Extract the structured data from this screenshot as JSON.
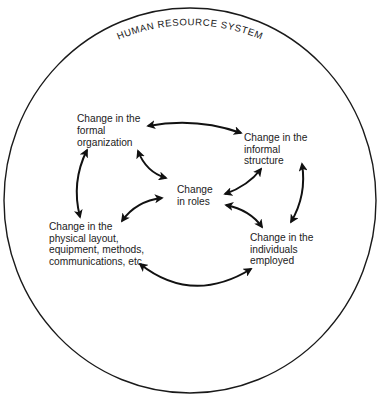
{
  "diagram": {
    "title": "HUMAN RESOURCE SYSTEM",
    "colors": {
      "line": "#111111",
      "text": "#222222",
      "background": "#ffffff"
    },
    "nodes": [
      {
        "id": "formal",
        "lines": [
          "Change in the",
          "formal",
          "organization"
        ]
      },
      {
        "id": "informal",
        "lines": [
          "Change in the",
          "informal",
          "structure"
        ]
      },
      {
        "id": "roles",
        "lines": [
          "Change",
          "in roles"
        ]
      },
      {
        "id": "physical",
        "lines": [
          "Change in the",
          "physical layout,",
          "equipment, methods,",
          "communications, etc."
        ]
      },
      {
        "id": "individuals",
        "lines": [
          "Change in the",
          "individuals",
          "employed"
        ]
      }
    ],
    "edges": [
      {
        "from": "formal",
        "to": "informal",
        "type": "bidirectional"
      },
      {
        "from": "formal",
        "to": "physical",
        "type": "bidirectional"
      },
      {
        "from": "formal",
        "to": "roles",
        "type": "bidirectional"
      },
      {
        "from": "informal",
        "to": "roles",
        "type": "bidirectional"
      },
      {
        "from": "informal",
        "to": "individuals",
        "type": "bidirectional"
      },
      {
        "from": "roles",
        "to": "physical",
        "type": "bidirectional"
      },
      {
        "from": "roles",
        "to": "individuals",
        "type": "bidirectional"
      },
      {
        "from": "physical",
        "to": "individuals",
        "type": "bidirectional"
      }
    ]
  }
}
